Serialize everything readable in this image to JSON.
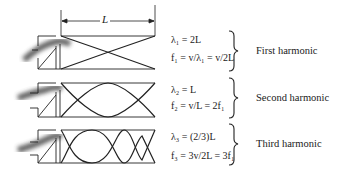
{
  "dimension_label": "L",
  "harmonics": [
    {
      "name": "First harmonic",
      "lambda_eq": "λ₁ = 2L",
      "freq_eq": "f₁ = v/λ₁ = v/2L",
      "nodes_in_pipe": 1
    },
    {
      "name": "Second harmonic",
      "lambda_eq": "λ₂ = L",
      "freq_eq": "f₂ = v/L = 2f₁",
      "nodes_in_pipe": 2
    },
    {
      "name": "Third harmonic",
      "lambda_eq": "λ₃ = (2/3)L",
      "freq_eq": "f₃ = 3v/2L = 3f₁",
      "nodes_in_pipe": 3
    }
  ]
}
